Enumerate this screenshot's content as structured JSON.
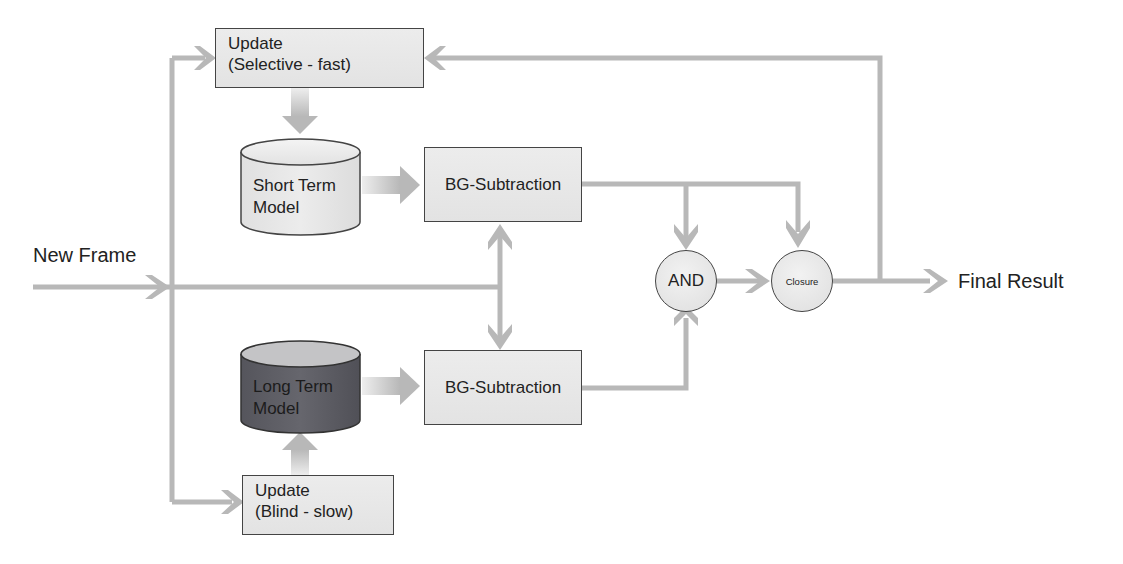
{
  "diagram": {
    "inputs": {
      "new_frame": "New Frame"
    },
    "outputs": {
      "final_result": "Final Result"
    },
    "nodes": {
      "update_fast": {
        "line1": "Update",
        "line2": "(Selective - fast)"
      },
      "update_slow": {
        "line1": "Update",
        "line2": "(Blind - slow)"
      },
      "short_term_model": {
        "line1": "Short Term",
        "line2": "Model"
      },
      "long_term_model": {
        "line1": "Long Term",
        "line2": "Model"
      },
      "bg_sub_top": {
        "label": "BG-Subtraction"
      },
      "bg_sub_bottom": {
        "label": "BG-Subtraction"
      },
      "and_node": {
        "label": "AND"
      },
      "closure_node": {
        "label": "Closure"
      }
    },
    "colors": {
      "wire": "#b8b8b8",
      "box_fill": "#e8e8e8",
      "box_border": "#444444",
      "short_term_fill": "#e6e6e6",
      "long_term_fill": "#5e5e66",
      "long_term_top": "#c4c4c6"
    }
  }
}
